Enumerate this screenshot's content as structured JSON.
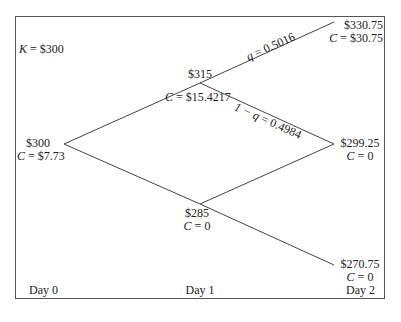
{
  "diagram": {
    "type": "binomial-tree",
    "strike": {
      "var": "K",
      "text": " = $300"
    },
    "nodes": {
      "d0": {
        "price": "$300",
        "call_var": "C",
        "call_text": " = $7.73"
      },
      "d1_up": {
        "price": "$315",
        "call_var": "C",
        "call_text": " = $15.4217"
      },
      "d1_down": {
        "price": "$285",
        "call_var": "C",
        "call_text": " = 0"
      },
      "d2_uu": {
        "price": "$330.75",
        "call_var": "C",
        "call_text": " = $30.75"
      },
      "d2_ud": {
        "price": "$299.25",
        "call_var": "C",
        "call_text": " = 0"
      },
      "d2_dd": {
        "price": "$270.75",
        "call_var": "C",
        "call_text": " = 0"
      }
    },
    "probabilities": {
      "up": {
        "var": "q",
        "text": " = 0.5016"
      },
      "down": {
        "var_prefix": "1 − ",
        "var": "q",
        "text": " = 0.4984"
      }
    },
    "axis_labels": [
      "Day 0",
      "Day 1",
      "Day 2"
    ],
    "line_color": "#444444"
  }
}
